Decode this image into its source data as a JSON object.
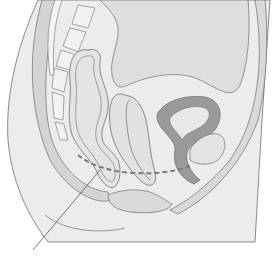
{
  "figure": {
    "type": "anatomical-illustration",
    "colors": {
      "background": "#ffffff",
      "tissue_light": "#e6e6e6",
      "tissue_mid": "#d4d4d4",
      "tissue_dark": "#9a9a9a",
      "vertebra": "#f2f2f2",
      "outline": "#6e6e6e",
      "dashed_line": "#7a7a7a",
      "leader_line": "#555555"
    },
    "annotations": {
      "dashed_line": "pelvic floor plane",
      "leader_line": "pointer to dashed line (label not visible)"
    }
  }
}
